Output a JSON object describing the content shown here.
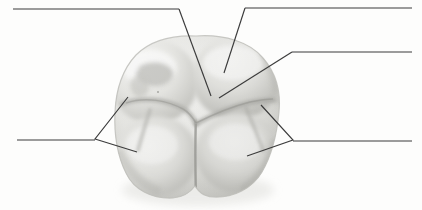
{
  "figure": {
    "background_color": "#fdfdfc",
    "line_color": "#3b3b3b",
    "width": 422,
    "height": 210
  },
  "specimen": {
    "name": "molar-tooth",
    "view": "occlusal",
    "rendering": "grayscale shaded illustration",
    "bounds": {
      "x": 114,
      "y": 36,
      "width": 166,
      "height": 163
    },
    "palette": {
      "highlight": "#f4f4f2",
      "midtone": "#dcdcd8",
      "shadow": "#b9b9b4",
      "deep_shadow": "#a2a29c",
      "fissure": "#9a9a95",
      "outline": "#c8c8c3"
    },
    "cusps": [
      {
        "name": "mesiobuccal-cusp",
        "cx": 152,
        "cy": 80
      },
      {
        "name": "distobuccal-cusp",
        "cx": 232,
        "cy": 76
      },
      {
        "name": "mesiolingual-cusp",
        "cx": 156,
        "cy": 155
      },
      {
        "name": "distolingual-cusp",
        "cx": 235,
        "cy": 152
      }
    ],
    "fissures": [
      {
        "name": "central-fissure"
      },
      {
        "name": "mesial-fissure"
      },
      {
        "name": "distal-fissure"
      },
      {
        "name": "buccal-groove"
      }
    ]
  },
  "labels": [
    {
      "id": "label-top-left",
      "name": "label-line-top-left",
      "text": "",
      "rule": {
        "x1": 13,
        "y1": 9,
        "x2": 179,
        "y2": 9
      },
      "leader": {
        "x1": 179,
        "y1": 9,
        "x2": 211,
        "y2": 96
      }
    },
    {
      "id": "label-top-right",
      "name": "label-line-top-right",
      "text": "",
      "rule": {
        "x1": 245,
        "y1": 8,
        "x2": 412,
        "y2": 8
      },
      "leader": {
        "x1": 245,
        "y1": 8,
        "x2": 224,
        "y2": 73
      }
    },
    {
      "id": "label-middle-right",
      "name": "label-line-middle-right",
      "text": "",
      "rule": {
        "x1": 292,
        "y1": 52,
        "x2": 412,
        "y2": 52
      },
      "leader": {
        "x1": 292,
        "y1": 52,
        "x2": 219,
        "y2": 98
      }
    },
    {
      "id": "label-left-bracket",
      "name": "label-line-left-bracket",
      "text": "",
      "rule": {
        "x1": 17,
        "y1": 140,
        "x2": 95,
        "y2": 140
      },
      "bracket": {
        "vertex_x": 95,
        "vertex_y": 139,
        "upper_x": 128,
        "upper_y": 97,
        "lower_x": 137,
        "lower_y": 152
      }
    },
    {
      "id": "label-right-bracket",
      "name": "label-line-right-bracket",
      "text": "",
      "rule": {
        "x1": 293,
        "y1": 141,
        "x2": 412,
        "y2": 141
      },
      "bracket": {
        "vertex_x": 293,
        "vertex_y": 140,
        "upper_x": 261,
        "upper_y": 105,
        "lower_x": 247,
        "lower_y": 156
      }
    }
  ]
}
